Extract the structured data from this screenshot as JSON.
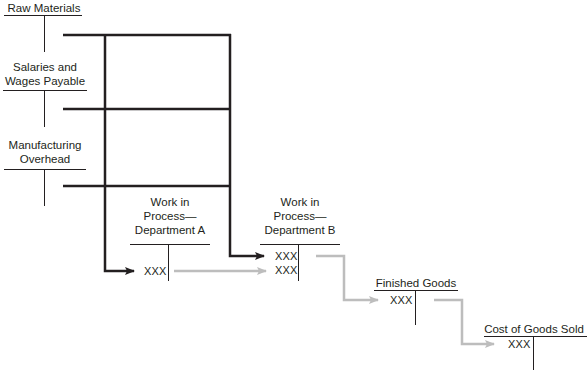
{
  "diagram": {
    "colors": {
      "cost_flow": "#231f20",
      "transfer_flow": "#bdbdbd",
      "text": "#231f20"
    },
    "accounts": [
      {
        "id": "raw-materials",
        "label_lines": [
          "Raw Materials"
        ],
        "entries": []
      },
      {
        "id": "salaries-wages-payable",
        "label_lines": [
          "Salaries and",
          "Wages Payable"
        ],
        "entries": []
      },
      {
        "id": "manufacturing-overhead",
        "label_lines": [
          "Manufacturing",
          "Overhead"
        ],
        "entries": []
      },
      {
        "id": "wip-dept-a",
        "label_lines": [
          "Work in",
          "Process—",
          "Department A"
        ],
        "entries": [
          "XXX"
        ]
      },
      {
        "id": "wip-dept-b",
        "label_lines": [
          "Work in",
          "Process—",
          "Department B"
        ],
        "entries": [
          "XXX",
          "XXX"
        ]
      },
      {
        "id": "finished-goods",
        "label_lines": [
          "Finished Goods"
        ],
        "entries": [
          "XXX"
        ]
      },
      {
        "id": "cogs",
        "label_lines": [
          "Cost of Goods Sold"
        ],
        "entries": [
          "XXX"
        ]
      }
    ],
    "flows": [
      {
        "from": [
          "raw-materials",
          "salaries-wages-payable",
          "manufacturing-overhead"
        ],
        "to": "wip-dept-a",
        "style": "dark"
      },
      {
        "from": [
          "raw-materials",
          "salaries-wages-payable",
          "manufacturing-overhead"
        ],
        "to": "wip-dept-b",
        "style": "dark"
      },
      {
        "from": "wip-dept-a",
        "to": "wip-dept-b",
        "style": "light"
      },
      {
        "from": "wip-dept-b",
        "to": "finished-goods",
        "style": "light"
      },
      {
        "from": "finished-goods",
        "to": "cogs",
        "style": "light"
      }
    ]
  }
}
